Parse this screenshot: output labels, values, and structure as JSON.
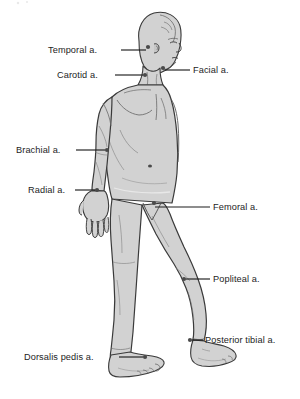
{
  "figure": {
    "background_color": "#ffffff",
    "body_fill_color": "#d2d2d2",
    "body_outline_color": "#3a3a3a",
    "label_text_color": "#1d1d1d",
    "leader_line_color": "#1d1d1d",
    "marker_color": "#4a4a4a"
  },
  "labels": [
    {
      "id": "temporal",
      "text": "Temporal a.",
      "side": "left",
      "text_x": 48,
      "text_y": 46,
      "text_anchor_x": 118,
      "leader_x1": 121,
      "leader_y1": 50,
      "leader_x2": 146,
      "leader_y2": 50,
      "marker_x": 148,
      "marker_y": 47
    },
    {
      "id": "carotid",
      "text": "Carotid a.",
      "side": "left",
      "text_x": 57,
      "text_y": 71,
      "text_anchor_x": 118,
      "leader_x1": 115,
      "leader_y1": 75,
      "leader_x2": 143,
      "leader_y2": 75,
      "marker_x": 145,
      "marker_y": 75
    },
    {
      "id": "facial",
      "text": "Facial a.",
      "side": "right",
      "text_x": 193,
      "text_y": 66,
      "leader_x1": 165,
      "leader_y1": 70,
      "leader_x2": 190,
      "leader_y2": 70,
      "marker_x": 163,
      "marker_y": 68
    },
    {
      "id": "brachial",
      "text": "Brachial a.",
      "side": "left",
      "text_x": 16,
      "text_y": 146,
      "leader_x1": 76,
      "leader_y1": 150,
      "leader_x2": 105,
      "leader_y2": 150,
      "marker_x": 107,
      "marker_y": 150
    },
    {
      "id": "radial",
      "text": "Radial a.",
      "side": "left",
      "text_x": 28,
      "text_y": 186,
      "leader_x1": 75,
      "leader_y1": 190,
      "leader_x2": 95,
      "leader_y2": 190,
      "marker_x": 97,
      "marker_y": 190
    },
    {
      "id": "femoral",
      "text": "Femoral a.",
      "side": "right",
      "text_x": 213,
      "text_y": 203,
      "leader_x1": 155,
      "leader_y1": 207,
      "leader_x2": 210,
      "leader_y2": 207,
      "marker_x": 154,
      "marker_y": 203
    },
    {
      "id": "popliteal",
      "text": "Popliteal a.",
      "side": "right",
      "text_x": 213,
      "text_y": 275,
      "leader_x1": 186,
      "leader_y1": 279,
      "leader_x2": 210,
      "leader_y2": 279,
      "marker_x": 184,
      "marker_y": 279
    },
    {
      "id": "posterior-tibial",
      "text": "Posterior tibial a.",
      "side": "right",
      "text_x": 205,
      "text_y": 336,
      "leader_x1": 192,
      "leader_y1": 340,
      "leader_x2": 203,
      "leader_y2": 340,
      "marker_x": 190,
      "marker_y": 340
    },
    {
      "id": "dorsalis-pedis",
      "text": "Dorsalis pedis a.",
      "side": "left",
      "text_x": 24,
      "text_y": 353,
      "leader_x1": 119,
      "leader_y1": 357,
      "leader_x2": 143,
      "leader_y2": 357,
      "marker_x": 145,
      "marker_y": 357
    }
  ]
}
